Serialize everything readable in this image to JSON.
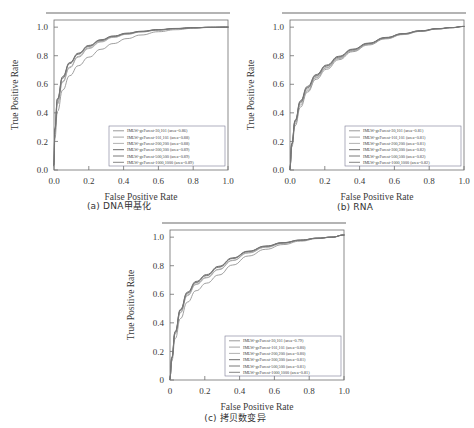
{
  "figure": {
    "panels": [
      {
        "id": "a",
        "caption": "(a) DNA甲基化",
        "xlabel": "False Positive Rate",
        "ylabel": "True Positive Rate",
        "xticks": [
          "0.0",
          "0.2",
          "0.4",
          "0.6",
          "0.8",
          "1.0"
        ],
        "yticks": [
          "0.0",
          "0.2",
          "0.4",
          "0.6",
          "0.8",
          "1.0"
        ],
        "legend": [
          "IMLW-gcForest-30,101 (area=0.86)",
          "IMLW-gcForest-101,101 (area=0.88)",
          "IMLW-gcForest-200,200 (area=0.88)",
          "IMLW-gcForest-300,300 (area=0.89)",
          "IMLW-gcForest-500,500 (area=0.89)",
          "IMLW-gcForest-1000,1000 (area=0.89)"
        ]
      },
      {
        "id": "b",
        "caption": "(b) RNA",
        "xlabel": "False Positive Rate",
        "ylabel": "True Positive Rate",
        "xticks": [
          "0.0",
          "0.2",
          "0.4",
          "0.6",
          "0.8",
          "1.0"
        ],
        "yticks": [
          "0.0",
          "0.2",
          "0.4",
          "0.6",
          "0.8",
          "1.0"
        ],
        "legend": [
          "IMLW-gcForest-30,101 (area=0.81)",
          "IMLW-gcForest-101,101 (area=0.81)",
          "IMLW-gcForest-200,200 (area=0.81)",
          "IMLW-gcForest-300,300 (area=0.82)",
          "IMLW-gcForest-500,500 (area=0.82)",
          "IMLW-gcForest-1000,1000 (area=0.82)"
        ]
      },
      {
        "id": "c",
        "caption": "(c) 拷贝数变异",
        "xlabel": "False Positive Rate",
        "ylabel": "True Positive Rate",
        "xticks": [
          "0",
          "0.2",
          "0.4",
          "0.6",
          "0.8",
          "1.0"
        ],
        "yticks": [
          "0",
          "0.2",
          "0.4",
          "0.6",
          "0.8",
          "1.0"
        ],
        "legend": [
          "IMLW-gcForest-30,101 (area=0.79)",
          "IMLW-gcForest-101,101 (area=0.80)",
          "IMLW-gcForest-200,200 (area=0.80)",
          "IMLW-gcForest-300,300 (area=0.81)",
          "IMLW-gcForest-500,500 (area=0.81)",
          "IMLW-gcForest-1000,1000 (area=0.81)"
        ]
      }
    ]
  },
  "chart_data": [
    {
      "type": "line",
      "title": "(a) DNA甲基化",
      "xlabel": "False Positive Rate",
      "ylabel": "True Positive Rate",
      "xlim": [
        0.0,
        1.0
      ],
      "ylim": [
        0.0,
        1.05
      ],
      "grid": false,
      "legend_position": "lower right",
      "series": [
        {
          "name": "IMLW-gcForest-30,101",
          "auc": 0.86,
          "color": "#8e8e8e",
          "x": [
            0.0,
            0.005,
            0.02,
            0.05,
            0.09,
            0.14,
            0.2,
            0.27,
            0.34,
            0.42,
            0.5,
            0.6,
            0.7,
            0.8,
            0.9,
            1.0
          ],
          "y": [
            0.02,
            0.22,
            0.41,
            0.56,
            0.66,
            0.73,
            0.79,
            0.845,
            0.885,
            0.92,
            0.945,
            0.968,
            0.982,
            0.992,
            0.998,
            1.0
          ]
        },
        {
          "name": "IMLW-gcForest-101,101",
          "auc": 0.88,
          "color": "#9a9a9a",
          "x": [
            0.0,
            0.005,
            0.02,
            0.05,
            0.09,
            0.14,
            0.2,
            0.27,
            0.34,
            0.42,
            0.5,
            0.6,
            0.7,
            0.8,
            0.9,
            1.0
          ],
          "y": [
            0.03,
            0.27,
            0.47,
            0.62,
            0.72,
            0.795,
            0.855,
            0.9,
            0.93,
            0.952,
            0.967,
            0.98,
            0.989,
            0.995,
            0.999,
            1.0
          ]
        },
        {
          "name": "IMLW-gcForest-200,200",
          "auc": 0.88,
          "color": "#a8a8a8",
          "x": [
            0.0,
            0.005,
            0.02,
            0.05,
            0.09,
            0.14,
            0.2,
            0.27,
            0.34,
            0.42,
            0.5,
            0.6,
            0.7,
            0.8,
            0.9,
            1.0
          ],
          "y": [
            0.03,
            0.26,
            0.46,
            0.615,
            0.715,
            0.79,
            0.85,
            0.896,
            0.928,
            0.95,
            0.966,
            0.979,
            0.988,
            0.995,
            0.999,
            1.0
          ]
        },
        {
          "name": "IMLW-gcForest-300,300",
          "auc": 0.89,
          "color": "#5d5d5d",
          "x": [
            0.0,
            0.005,
            0.02,
            0.05,
            0.09,
            0.14,
            0.2,
            0.27,
            0.34,
            0.42,
            0.5,
            0.6,
            0.7,
            0.8,
            0.9,
            1.0
          ],
          "y": [
            0.03,
            0.29,
            0.5,
            0.655,
            0.752,
            0.818,
            0.872,
            0.912,
            0.938,
            0.958,
            0.971,
            0.983,
            0.991,
            0.996,
            0.999,
            1.0
          ]
        },
        {
          "name": "IMLW-gcForest-500,500",
          "auc": 0.89,
          "color": "#6b6b6b",
          "x": [
            0.0,
            0.005,
            0.02,
            0.05,
            0.09,
            0.14,
            0.2,
            0.27,
            0.34,
            0.42,
            0.5,
            0.6,
            0.7,
            0.8,
            0.9,
            1.0
          ],
          "y": [
            0.03,
            0.285,
            0.495,
            0.648,
            0.748,
            0.814,
            0.868,
            0.909,
            0.936,
            0.956,
            0.97,
            0.982,
            0.99,
            0.996,
            0.999,
            1.0
          ]
        },
        {
          "name": "IMLW-gcForest-1000,1000",
          "auc": 0.89,
          "color": "#787878",
          "x": [
            0.0,
            0.005,
            0.02,
            0.05,
            0.09,
            0.14,
            0.2,
            0.27,
            0.34,
            0.42,
            0.5,
            0.6,
            0.7,
            0.8,
            0.9,
            1.0
          ],
          "y": [
            0.03,
            0.28,
            0.49,
            0.642,
            0.744,
            0.81,
            0.865,
            0.906,
            0.934,
            0.954,
            0.969,
            0.981,
            0.99,
            0.996,
            0.999,
            1.0
          ]
        }
      ]
    },
    {
      "type": "line",
      "title": "(b) RNA",
      "xlabel": "False Positive Rate",
      "ylabel": "True Positive Rate",
      "xlim": [
        0.0,
        1.0
      ],
      "ylim": [
        0.0,
        1.05
      ],
      "grid": false,
      "legend_position": "lower right",
      "series": [
        {
          "name": "IMLW-gcForest-30,101",
          "auc": 0.81,
          "color": "#8e8e8e",
          "x": [
            0.0,
            0.01,
            0.03,
            0.06,
            0.1,
            0.15,
            0.21,
            0.28,
            0.36,
            0.45,
            0.55,
            0.65,
            0.75,
            0.85,
            0.93,
            1.0
          ],
          "y": [
            0.0,
            0.16,
            0.31,
            0.44,
            0.545,
            0.635,
            0.705,
            0.772,
            0.828,
            0.875,
            0.918,
            0.948,
            0.97,
            0.987,
            0.996,
            1.005
          ]
        },
        {
          "name": "IMLW-gcForest-101,101",
          "auc": 0.81,
          "color": "#9a9a9a",
          "x": [
            0.0,
            0.01,
            0.03,
            0.06,
            0.1,
            0.15,
            0.21,
            0.28,
            0.36,
            0.45,
            0.55,
            0.65,
            0.75,
            0.85,
            0.93,
            1.0
          ],
          "y": [
            0.0,
            0.17,
            0.325,
            0.455,
            0.555,
            0.645,
            0.715,
            0.78,
            0.833,
            0.879,
            0.921,
            0.95,
            0.971,
            0.988,
            0.996,
            1.005
          ]
        },
        {
          "name": "IMLW-gcForest-200,200",
          "auc": 0.81,
          "color": "#a8a8a8",
          "x": [
            0.0,
            0.01,
            0.03,
            0.06,
            0.1,
            0.15,
            0.21,
            0.28,
            0.36,
            0.45,
            0.55,
            0.65,
            0.75,
            0.85,
            0.93,
            1.0
          ],
          "y": [
            0.0,
            0.175,
            0.335,
            0.468,
            0.565,
            0.65,
            0.718,
            0.782,
            0.835,
            0.88,
            0.922,
            0.951,
            0.972,
            0.988,
            0.996,
            1.005
          ]
        },
        {
          "name": "IMLW-gcForest-300,300",
          "auc": 0.82,
          "color": "#5d5d5d",
          "x": [
            0.0,
            0.01,
            0.03,
            0.06,
            0.1,
            0.15,
            0.21,
            0.28,
            0.36,
            0.45,
            0.55,
            0.65,
            0.75,
            0.85,
            0.93,
            1.0
          ],
          "y": [
            0.0,
            0.185,
            0.35,
            0.485,
            0.585,
            0.668,
            0.735,
            0.796,
            0.846,
            0.888,
            0.928,
            0.955,
            0.975,
            0.99,
            0.997,
            1.005
          ]
        },
        {
          "name": "IMLW-gcForest-500,500",
          "auc": 0.82,
          "color": "#6b6b6b",
          "x": [
            0.0,
            0.01,
            0.03,
            0.06,
            0.1,
            0.15,
            0.21,
            0.28,
            0.36,
            0.45,
            0.55,
            0.65,
            0.75,
            0.85,
            0.93,
            1.0
          ],
          "y": [
            0.0,
            0.182,
            0.345,
            0.478,
            0.578,
            0.662,
            0.73,
            0.792,
            0.843,
            0.886,
            0.926,
            0.954,
            0.974,
            0.989,
            0.997,
            1.005
          ]
        },
        {
          "name": "IMLW-gcForest-1000,1000",
          "auc": 0.82,
          "color": "#787878",
          "x": [
            0.0,
            0.01,
            0.03,
            0.06,
            0.1,
            0.15,
            0.21,
            0.28,
            0.36,
            0.45,
            0.55,
            0.65,
            0.75,
            0.85,
            0.93,
            1.0
          ],
          "y": [
            0.0,
            0.18,
            0.342,
            0.474,
            0.574,
            0.658,
            0.727,
            0.789,
            0.841,
            0.884,
            0.925,
            0.953,
            0.973,
            0.989,
            0.997,
            1.005
          ]
        }
      ]
    },
    {
      "type": "line",
      "title": "(c) 拷贝数变异",
      "xlabel": "False Positive Rate",
      "ylabel": "True Positive Rate",
      "xlim": [
        0.0,
        1.0
      ],
      "ylim": [
        0.0,
        1.05
      ],
      "grid": false,
      "legend_position": "lower right",
      "series": [
        {
          "name": "IMLW-gcForest-30,101",
          "auc": 0.79,
          "color": "#8e8e8e",
          "x": [
            0.0,
            0.01,
            0.03,
            0.06,
            0.1,
            0.15,
            0.21,
            0.28,
            0.36,
            0.45,
            0.55,
            0.65,
            0.75,
            0.85,
            0.93,
            1.0
          ],
          "y": [
            0.0,
            0.13,
            0.29,
            0.43,
            0.545,
            0.625,
            0.678,
            0.735,
            0.805,
            0.868,
            0.915,
            0.948,
            0.972,
            0.99,
            0.999,
            1.015
          ]
        },
        {
          "name": "IMLW-gcForest-101,101",
          "auc": 0.8,
          "color": "#9a9a9a",
          "x": [
            0.0,
            0.01,
            0.03,
            0.06,
            0.1,
            0.15,
            0.21,
            0.28,
            0.36,
            0.45,
            0.55,
            0.65,
            0.75,
            0.85,
            0.93,
            1.0
          ],
          "y": [
            0.0,
            0.15,
            0.325,
            0.475,
            0.595,
            0.672,
            0.718,
            0.775,
            0.838,
            0.891,
            0.93,
            0.957,
            0.977,
            0.992,
            1.0,
            1.015
          ]
        },
        {
          "name": "IMLW-gcForest-200,200",
          "auc": 0.8,
          "color": "#a8a8a8",
          "x": [
            0.0,
            0.01,
            0.03,
            0.06,
            0.1,
            0.15,
            0.21,
            0.28,
            0.36,
            0.45,
            0.55,
            0.65,
            0.75,
            0.85,
            0.93,
            1.0
          ],
          "y": [
            0.0,
            0.148,
            0.322,
            0.47,
            0.59,
            0.668,
            0.715,
            0.772,
            0.836,
            0.889,
            0.929,
            0.956,
            0.976,
            0.992,
            1.0,
            1.015
          ]
        },
        {
          "name": "IMLW-gcForest-300,300",
          "auc": 0.81,
          "color": "#5d5d5d",
          "x": [
            0.0,
            0.01,
            0.03,
            0.06,
            0.1,
            0.15,
            0.21,
            0.28,
            0.36,
            0.45,
            0.55,
            0.65,
            0.75,
            0.85,
            0.93,
            1.0
          ],
          "y": [
            0.0,
            0.158,
            0.34,
            0.495,
            0.615,
            0.69,
            0.738,
            0.796,
            0.855,
            0.902,
            0.938,
            0.962,
            0.98,
            0.993,
            1.0,
            1.015
          ]
        },
        {
          "name": "IMLW-gcForest-500,500",
          "auc": 0.81,
          "color": "#6b6b6b",
          "x": [
            0.0,
            0.01,
            0.03,
            0.06,
            0.1,
            0.15,
            0.21,
            0.28,
            0.36,
            0.45,
            0.55,
            0.65,
            0.75,
            0.85,
            0.93,
            1.0
          ],
          "y": [
            0.0,
            0.155,
            0.336,
            0.49,
            0.61,
            0.685,
            0.733,
            0.792,
            0.852,
            0.9,
            0.936,
            0.961,
            0.979,
            0.993,
            1.0,
            1.015
          ]
        },
        {
          "name": "IMLW-gcForest-1000,1000",
          "auc": 0.81,
          "color": "#787878",
          "x": [
            0.0,
            0.01,
            0.03,
            0.06,
            0.1,
            0.15,
            0.21,
            0.28,
            0.36,
            0.45,
            0.55,
            0.65,
            0.75,
            0.85,
            0.93,
            1.0
          ],
          "y": [
            0.0,
            0.152,
            0.333,
            0.486,
            0.606,
            0.682,
            0.73,
            0.789,
            0.85,
            0.898,
            0.935,
            0.96,
            0.978,
            0.993,
            1.0,
            1.015
          ]
        }
      ]
    }
  ]
}
